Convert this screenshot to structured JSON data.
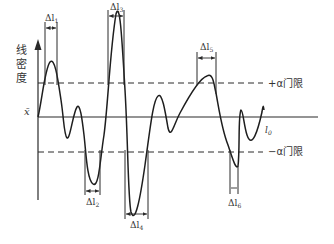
{
  "diagram": {
    "type": "signal-threshold-diagram",
    "y_axis_label_chars": [
      "线",
      "密",
      "度"
    ],
    "mean_label": "x̄",
    "baseline_label": "l",
    "baseline_subscript": "0",
    "upper_threshold_label": "+α门限",
    "lower_threshold_label": "−α门限",
    "intervals": [
      {
        "id": "l1",
        "delta": "Δl",
        "sub": "1",
        "position": "top"
      },
      {
        "id": "l2",
        "delta": "Δl",
        "sub": "2",
        "position": "bottom"
      },
      {
        "id": "l3",
        "delta": "Δl",
        "sub": "3",
        "position": "top"
      },
      {
        "id": "l4",
        "delta": "Δl",
        "sub": "4",
        "position": "bottom"
      },
      {
        "id": "l5",
        "delta": "Δl",
        "sub": "5",
        "position": "top"
      },
      {
        "id": "l6",
        "delta": "Δl",
        "sub": "6",
        "position": "bottom"
      }
    ],
    "colors": {
      "stroke": "#2a2a2a",
      "text": "#333333",
      "background": "#ffffff"
    }
  }
}
